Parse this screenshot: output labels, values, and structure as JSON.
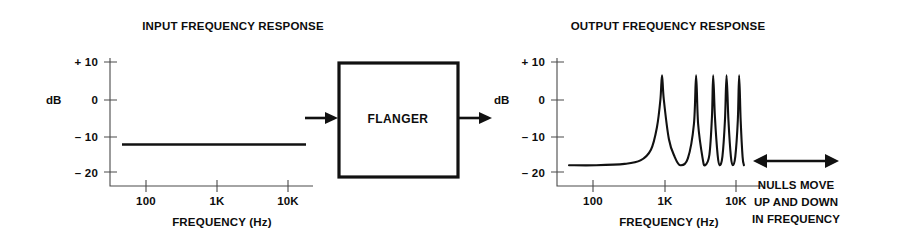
{
  "figure": {
    "caption_absent": true
  },
  "input_chart": {
    "title": "INPUT FREQUENCY RESPONSE",
    "y_axis_title": "dB",
    "x_axis_title": "FREQUENCY (Hz)",
    "y_ticks": [
      "+ 10",
      "0",
      "– 10",
      "– 20"
    ],
    "x_ticks": [
      "100",
      "1K",
      "10K"
    ]
  },
  "output_chart": {
    "title": "OUTPUT FREQUENCY RESPONSE",
    "y_axis_title": "dB",
    "x_axis_title": "FREQUENCY (Hz)",
    "y_ticks": [
      "+ 10",
      "0",
      "– 10",
      "– 20"
    ],
    "x_ticks": [
      "100",
      "1K",
      "10K"
    ]
  },
  "processor": {
    "label": "FLANGER",
    "input_arrow": "arrow-right-icon",
    "output_arrow": "arrow-right-icon"
  },
  "annotation": {
    "arrow": "double-arrow-horizontal-icon",
    "lines": [
      "NULLS MOVE",
      "UP AND DOWN",
      "IN FREQUENCY"
    ]
  },
  "colors": {
    "ink": "#111111",
    "axis": "#4a4a4a",
    "background": "#ffffff"
  },
  "chart_data": [
    {
      "type": "line",
      "id": "input-frequency-response",
      "title": "INPUT FREQUENCY RESPONSE",
      "xlabel": "FREQUENCY (Hz)",
      "ylabel": "dB",
      "x_scale": "log",
      "xlim": [
        50,
        20000
      ],
      "ylim": [
        -25,
        12
      ],
      "yticks": [
        10,
        0,
        -10,
        -20
      ],
      "ytick_labels": [
        "+ 10",
        "0",
        "– 10",
        "– 20"
      ],
      "xticks": [
        100,
        1000,
        10000
      ],
      "xtick_labels": [
        "100",
        "1K",
        "10K"
      ],
      "grid": false,
      "legend": "none",
      "series": [
        {
          "name": "input response",
          "description": "flat 0 dB response across the full audio band",
          "x": [
            50,
            100,
            200,
            500,
            1000,
            2000,
            5000,
            10000,
            20000
          ],
          "values": [
            0,
            0,
            0,
            0,
            0,
            0,
            0,
            0,
            0
          ]
        }
      ]
    },
    {
      "type": "line",
      "id": "output-frequency-response",
      "title": "OUTPUT FREQUENCY RESPONSE",
      "xlabel": "FREQUENCY (Hz)",
      "ylabel": "dB",
      "x_scale": "log",
      "xlim": [
        50,
        20000
      ],
      "ylim": [
        -25,
        12
      ],
      "yticks": [
        10,
        0,
        -10,
        -20
      ],
      "ytick_labels": [
        "+ 10",
        "0",
        "– 10",
        "– 20"
      ],
      "xticks": [
        100,
        1000,
        10000
      ],
      "xtick_labels": [
        "100",
        "1K",
        "10K"
      ],
      "grid": false,
      "legend": "none",
      "notes": "comb filter response: flat +6 dB shelf up to roughly 500 Hz, then a series of deep nulls reaching -20 dB at 1K, 3K, 5K, 8K and 12K with +6 dB peaks between them",
      "nulls_hz": [
        1000,
        3000,
        5200,
        8000,
        12000
      ],
      "peaks_hz": [
        1800,
        4000,
        6400,
        9800,
        14000
      ],
      "peak_level_db": 6,
      "null_level_db": -20,
      "shelf_level_db": 6,
      "series": [
        {
          "name": "output response",
          "description": "comb-filtered response with five nulls",
          "x": [
            50,
            120,
            300,
            500,
            700,
            850,
            950,
            1000,
            1060,
            1250,
            1500,
            1800,
            2300,
            2800,
            3000,
            3200,
            3700,
            4000,
            4600,
            5000,
            5200,
            5500,
            6000,
            6400,
            7000,
            7600,
            8000,
            8500,
            9200,
            9800,
            10600,
            11500,
            12000,
            12600,
            13400,
            14000
          ],
          "values": [
            6,
            6,
            5.6,
            4.6,
            1.5,
            -5,
            -13,
            -20,
            -13,
            -1.5,
            3.5,
            6,
            4,
            -6,
            -20,
            -6,
            4,
            6,
            3,
            -8,
            -20,
            -8,
            3,
            6,
            3.5,
            -7,
            -20,
            -7,
            3.5,
            6,
            3.5,
            -7,
            -20,
            -7,
            3.5,
            6
          ]
        }
      ]
    }
  ]
}
